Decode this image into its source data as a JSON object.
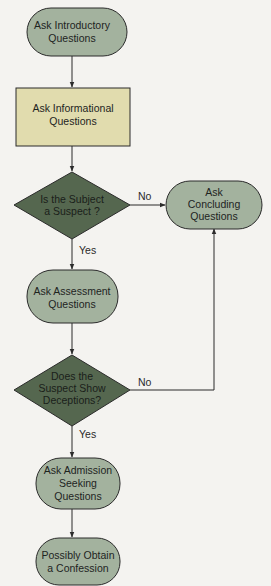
{
  "colors": {
    "background": "#f4f3f0",
    "terminal_fill": "#a3b29e",
    "process_fill": "#e1dcae",
    "decision_fill": "#55674f",
    "stroke": "#2b2b2b"
  },
  "nodes": {
    "intro": {
      "type": "terminal",
      "lines": [
        "Ask Introductory",
        "Questions"
      ]
    },
    "informational": {
      "type": "process",
      "lines": [
        "Ask Informational",
        "Questions"
      ]
    },
    "decision_suspect": {
      "type": "decision",
      "lines": [
        "Is the Subject",
        "a Suspect ?"
      ]
    },
    "concluding": {
      "type": "terminal",
      "lines": [
        "Ask",
        "Concluding",
        "Questions"
      ]
    },
    "assessment": {
      "type": "terminal",
      "lines": [
        "Ask Assessment",
        "Questions"
      ]
    },
    "decision_deception": {
      "type": "decision",
      "lines": [
        "Does the",
        "Suspect Show",
        "Deceptions?"
      ]
    },
    "admission": {
      "type": "terminal",
      "lines": [
        "Ask Admission",
        "Seeking",
        "Questions"
      ]
    },
    "confession": {
      "type": "terminal",
      "lines": [
        "Possibly Obtain",
        "a Confession"
      ]
    }
  },
  "edges": {
    "suspect_no": "No",
    "suspect_yes": "Yes",
    "deception_no": "No",
    "deception_yes": "Yes"
  }
}
